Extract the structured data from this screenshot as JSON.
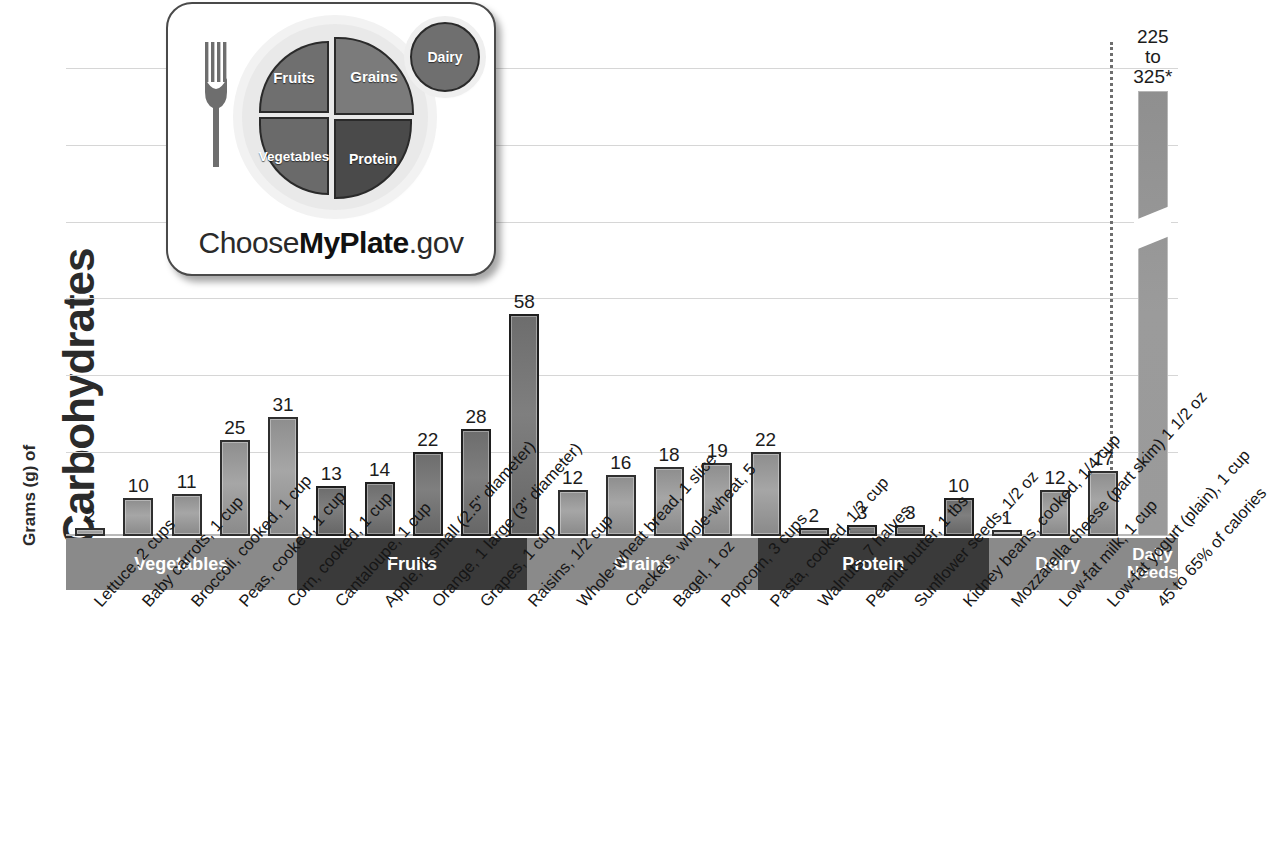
{
  "axis": {
    "ylabel_small": "Grams (g) of",
    "ylabel_big": "Carbohydrates"
  },
  "logo": {
    "fruits": "Fruits",
    "vegetables": "Vegetables",
    "grains": "Grains",
    "protein": "Protein",
    "dairy": "Dairy",
    "wordmark_pre": "Choose",
    "wordmark_bold": "MyPlate",
    "wordmark_post": ".gov"
  },
  "groups": [
    {
      "label": "Vegetables",
      "shade": "light",
      "count": 5
    },
    {
      "label": "Fruits",
      "shade": "dark",
      "count": 5
    },
    {
      "label": "Grains",
      "shade": "light",
      "count": 5
    },
    {
      "label": "Protein",
      "shade": "dark",
      "count": 5
    },
    {
      "label": "Dairy",
      "shade": "light",
      "count": 3
    },
    {
      "label": "Daily\nNeeds",
      "shade": "daily",
      "count": 1
    }
  ],
  "chart_data": {
    "type": "bar",
    "title": "Grams (g) of Carbohydrates",
    "xlabel": "",
    "ylabel": "Grams (g) of Carbohydrates",
    "ylim": [
      0,
      62
    ],
    "grid": true,
    "gridlines_count": 6,
    "tick_labels": [],
    "legend": "none",
    "footnote_marker": "*",
    "categories": [
      "Lettuce, 2 cups",
      "Baby carrots, 1 cup",
      "Broccoli, cooked, 1 cup",
      "Peas, cooked, 1 cup",
      "Corn, cooked, 1 cup",
      "Cantaloupe, 1 cup",
      "Apple, 1 small (2.5\" diameter)",
      "Orange, 1 large (3\" diameter)",
      "Grapes, 1 cup",
      "Raisins, 1/2 cup",
      "Whole-wheat\nbread, 1 slice",
      "Crackers, whole-wheat, 5",
      "Bagel, 1 oz",
      "Popcorn, 3 cups",
      "Pasta, cooked, 1/2 cup",
      "Walnuts, 7 halves",
      "Peanut butter, 1 tbs",
      "Sunflower seeds, 1/2 oz",
      "Kidney beans, cooked, 1/4 cup",
      "Mozzarella cheese\n(part skim) 1 1/2 oz",
      "Low-fat milk, 1 cup",
      "Low-fat yogurt (plain), 1 cup",
      "45 to 65% of calories"
    ],
    "values": [
      2,
      10,
      11,
      25,
      31,
      13,
      14,
      22,
      28,
      58,
      12,
      16,
      18,
      19,
      22,
      2,
      3,
      3,
      10,
      1,
      12,
      17,
      null
    ],
    "value_labels": [
      "2",
      "10",
      "11",
      "25",
      "31",
      "13",
      "14",
      "22",
      "28",
      "58",
      "12",
      "16",
      "18",
      "19",
      "22",
      "2",
      "3",
      "3",
      "10",
      "1",
      "12",
      "17",
      "225 to\n325*"
    ],
    "groups": [
      "Vegetables",
      "Vegetables",
      "Vegetables",
      "Vegetables",
      "Vegetables",
      "Fruits",
      "Fruits",
      "Fruits",
      "Fruits",
      "Fruits",
      "Grains",
      "Grains",
      "Grains",
      "Grains",
      "Grains",
      "Protein",
      "Protein",
      "Protein",
      "Protein",
      "Dairy",
      "Dairy",
      "Dairy",
      "Daily Needs"
    ],
    "daily_needs": {
      "label": "225 to\n325*",
      "min": 225,
      "max": 325,
      "axis_broken": true
    }
  },
  "bars": [
    {
      "value_label": "2",
      "value": 2,
      "shade": "light",
      "category": "Lettuce, 2 cups"
    },
    {
      "value_label": "10",
      "value": 10,
      "shade": "light",
      "category": "Baby carrots, 1 cup"
    },
    {
      "value_label": "11",
      "value": 11,
      "shade": "light",
      "category": "Broccoli, cooked, 1 cup"
    },
    {
      "value_label": "25",
      "value": 25,
      "shade": "light",
      "category": "Peas, cooked, 1 cup"
    },
    {
      "value_label": "31",
      "value": 31,
      "shade": "light",
      "category": "Corn, cooked, 1 cup"
    },
    {
      "value_label": "13",
      "value": 13,
      "shade": "dark",
      "category": "Cantaloupe, 1 cup"
    },
    {
      "value_label": "14",
      "value": 14,
      "shade": "dark",
      "category": "Apple, 1 small (2.5\" diameter)"
    },
    {
      "value_label": "22",
      "value": 22,
      "shade": "dark",
      "category": "Orange, 1 large (3\" diameter)"
    },
    {
      "value_label": "28",
      "value": 28,
      "shade": "dark",
      "category": "Grapes, 1 cup"
    },
    {
      "value_label": "58",
      "value": 58,
      "shade": "dark",
      "category": "Raisins, 1/2 cup"
    },
    {
      "value_label": "12",
      "value": 12,
      "shade": "light",
      "category": "Whole-wheat bread, 1 slice"
    },
    {
      "value_label": "16",
      "value": 16,
      "shade": "light",
      "category": "Crackers, whole-wheat, 5"
    },
    {
      "value_label": "18",
      "value": 18,
      "shade": "light",
      "category": "Bagel, 1 oz"
    },
    {
      "value_label": "19",
      "value": 19,
      "shade": "light",
      "category": "Popcorn, 3 cups"
    },
    {
      "value_label": "22",
      "value": 22,
      "shade": "light",
      "category": "Pasta, cooked, 1/2 cup"
    },
    {
      "value_label": "2",
      "value": 2,
      "shade": "dark",
      "category": "Walnuts, 7 halves"
    },
    {
      "value_label": "3",
      "value": 3,
      "shade": "dark",
      "category": "Peanut butter, 1 tbs"
    },
    {
      "value_label": "3",
      "value": 3,
      "shade": "dark",
      "category": "Sunflower seeds, 1/2 oz"
    },
    {
      "value_label": "10",
      "value": 10,
      "shade": "dark",
      "category": "Kidney beans, cooked, 1/4 cup"
    },
    {
      "value_label": "1",
      "value": 1,
      "shade": "light",
      "category": "Mozzarella cheese (part skim) 1 1/2 oz"
    },
    {
      "value_label": "12",
      "value": 12,
      "shade": "light",
      "category": "Low-fat milk, 1 cup"
    },
    {
      "value_label": "17",
      "value": 17,
      "shade": "light",
      "category": "Low-fat yogurt (plain), 1 cup"
    },
    {
      "value_label": "225 to\n325*",
      "value": null,
      "shade": "daily",
      "category": "45 to 65% of calories"
    }
  ],
  "colors": {
    "bar_light": "#a6a6a6",
    "bar_dark": "#7f7f7f",
    "band_light": "#8a8a8a",
    "band_dark": "#3a3a3a",
    "grid": "#d6d6d6",
    "text": "#1a1a1a"
  }
}
